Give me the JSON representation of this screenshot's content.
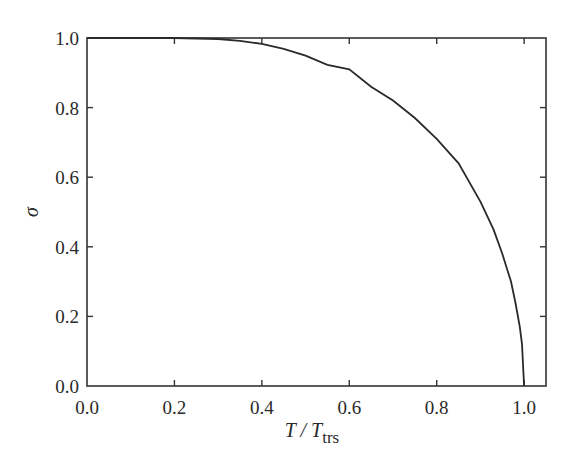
{
  "chart_data": {
    "type": "line",
    "title": "",
    "xlabel": "T / T_trs",
    "xlabel_parts": {
      "main": "T / T",
      "subscript": "trs"
    },
    "ylabel": "σ",
    "xlim": [
      0.0,
      1.05
    ],
    "ylim": [
      0.0,
      1.0
    ],
    "xticks": [
      "0.0",
      "0.2",
      "0.4",
      "0.6",
      "0.8",
      "1.0"
    ],
    "yticks": [
      "0.0",
      "0.2",
      "0.4",
      "0.6",
      "0.8",
      "1.0"
    ],
    "grid": false,
    "legend": null,
    "series": [
      {
        "name": "σ(T/T_trs)",
        "color": "#2a2a2a",
        "x": [
          0.0,
          0.1,
          0.2,
          0.3,
          0.35,
          0.4,
          0.45,
          0.5,
          0.55,
          0.6,
          0.65,
          0.7,
          0.75,
          0.8,
          0.85,
          0.9,
          0.93,
          0.95,
          0.97,
          0.98,
          0.99,
          0.995,
          1.0
        ],
        "y": [
          1.0,
          1.0,
          1.0,
          0.997,
          0.992,
          0.983,
          0.969,
          0.949,
          0.923,
          0.91,
          0.86,
          0.82,
          0.77,
          0.71,
          0.64,
          0.53,
          0.45,
          0.38,
          0.3,
          0.24,
          0.17,
          0.12,
          0.0
        ]
      }
    ]
  }
}
